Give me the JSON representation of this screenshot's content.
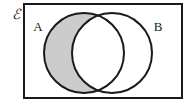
{
  "figure": {
    "kind": "venn-diagram",
    "shaded_region_description": "A only (A intersect B complement)"
  },
  "universal_set": {
    "symbol": "ℰ",
    "name": "universal-set-symbol",
    "position": {
      "x": 12,
      "y": 19
    }
  },
  "rectangle": {
    "name": "universal-set-rectangle",
    "x": 24,
    "y": 4,
    "width": 158,
    "height": 94,
    "stroke": "#1a1a1a",
    "stroke_width": 2,
    "fill": "#ffffff"
  },
  "circles": [
    {
      "id": "A",
      "label": "A",
      "cx": 84,
      "cy": 53,
      "r": 40,
      "stroke": "#1a1a1a",
      "stroke_width": 2,
      "label_position": {
        "x": 38,
        "y": 31
      }
    },
    {
      "id": "B",
      "label": "B",
      "cx": 112,
      "cy": 53,
      "r": 40,
      "stroke": "#1a1a1a",
      "stroke_width": 2,
      "label_position": {
        "x": 158,
        "y": 31
      }
    }
  ],
  "shading": {
    "region": "A-only",
    "color": "#cccccc"
  },
  "colors": {
    "background": "#ffffff",
    "outline": "#1a1a1a",
    "shade": "#cccccc"
  }
}
